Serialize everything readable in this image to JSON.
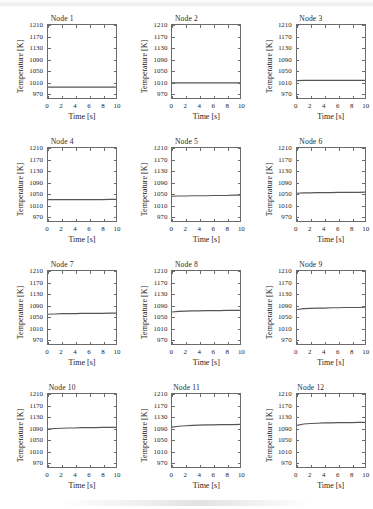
{
  "figure": {
    "layout": {
      "rows": 4,
      "cols": 3,
      "panel_count": 12
    },
    "axis": {
      "xlabel": "Time [s]",
      "ylabel": "Temperature [K]",
      "xticks": [
        0,
        2,
        4,
        6,
        8,
        10
      ],
      "yticks": [
        970,
        1010,
        1050,
        1090,
        1130,
        1170,
        1210
      ],
      "xlim": [
        0,
        10
      ],
      "ylim": [
        950,
        1210
      ],
      "grid": false,
      "line_color": "#555555"
    }
  },
  "chart_data": [
    {
      "type": "line",
      "title": "Node 1",
      "xlabel": "Time [s]",
      "ylabel": "Temperature [K]",
      "xlim": [
        0,
        10
      ],
      "ylim": [
        950,
        1210
      ],
      "xticks": [
        0,
        2,
        4,
        6,
        8,
        10
      ],
      "yticks": [
        970,
        1010,
        1050,
        1090,
        1130,
        1170,
        1210
      ],
      "grid": false,
      "x": [
        0,
        1,
        2,
        3,
        4,
        5,
        6,
        7,
        8,
        9,
        10
      ],
      "values": [
        989,
        989,
        989,
        989,
        989,
        989,
        989,
        989,
        989,
        989,
        989
      ]
    },
    {
      "type": "line",
      "title": "Node 2",
      "xlabel": "Time [s]",
      "ylabel": "Temperature [K]",
      "xlim": [
        0,
        10
      ],
      "ylim": [
        950,
        1210
      ],
      "xticks": [
        0,
        2,
        4,
        6,
        8,
        10
      ],
      "yticks": [
        970,
        1010,
        1050,
        1090,
        1130,
        1170,
        1210
      ],
      "grid": false,
      "x": [
        0,
        1,
        2,
        3,
        4,
        5,
        6,
        7,
        8,
        9,
        10
      ],
      "values": [
        1004,
        1004,
        1004,
        1004,
        1004,
        1004,
        1004,
        1004,
        1004,
        1004,
        1004
      ]
    },
    {
      "type": "line",
      "title": "Node 3",
      "xlabel": "Time [s]",
      "ylabel": "Temperature [K]",
      "xlim": [
        0,
        10
      ],
      "ylim": [
        950,
        1210
      ],
      "xticks": [
        0,
        2,
        4,
        6,
        8,
        10
      ],
      "yticks": [
        970,
        1010,
        1050,
        1090,
        1130,
        1170,
        1210
      ],
      "grid": false,
      "x": [
        0,
        1,
        2,
        3,
        4,
        5,
        6,
        7,
        8,
        9,
        10
      ],
      "values": [
        1012,
        1013,
        1013,
        1013,
        1013,
        1013,
        1013,
        1013,
        1013,
        1013,
        1013
      ]
    },
    {
      "type": "line",
      "title": "Node 4",
      "xlabel": "Time [s]",
      "ylabel": "Temperature [K]",
      "xlim": [
        0,
        10
      ],
      "ylim": [
        950,
        1210
      ],
      "xticks": [
        0,
        2,
        4,
        6,
        8,
        10
      ],
      "yticks": [
        970,
        1010,
        1050,
        1090,
        1130,
        1170,
        1210
      ],
      "grid": false,
      "x": [
        0,
        1,
        2,
        3,
        4,
        5,
        6,
        7,
        8,
        9,
        10
      ],
      "values": [
        1026,
        1026,
        1026,
        1026,
        1026,
        1026,
        1026,
        1026,
        1026,
        1027,
        1027
      ]
    },
    {
      "type": "line",
      "title": "Node 5",
      "xlabel": "Time [s]",
      "ylabel": "Temperature [K]",
      "xlim": [
        0,
        10
      ],
      "ylim": [
        950,
        1210
      ],
      "xticks": [
        0,
        2,
        4,
        6,
        8,
        10
      ],
      "yticks": [
        970,
        1010,
        1050,
        1090,
        1130,
        1170,
        1210
      ],
      "grid": false,
      "x": [
        0,
        1,
        2,
        3,
        4,
        5,
        6,
        7,
        8,
        9,
        10
      ],
      "values": [
        1038,
        1039,
        1039,
        1040,
        1040,
        1040,
        1041,
        1041,
        1041,
        1042,
        1042
      ]
    },
    {
      "type": "line",
      "title": "Node 6",
      "xlabel": "Time [s]",
      "ylabel": "Temperature [K]",
      "xlim": [
        0,
        10
      ],
      "ylim": [
        950,
        1210
      ],
      "xticks": [
        0,
        2,
        4,
        6,
        8,
        10
      ],
      "yticks": [
        970,
        1010,
        1050,
        1090,
        1130,
        1170,
        1210
      ],
      "grid": false,
      "x": [
        0,
        1,
        2,
        3,
        4,
        5,
        6,
        7,
        8,
        9,
        10
      ],
      "values": [
        1049,
        1050,
        1050,
        1051,
        1051,
        1051,
        1052,
        1052,
        1052,
        1052,
        1053
      ]
    },
    {
      "type": "line",
      "title": "Node 7",
      "xlabel": "Time [s]",
      "ylabel": "Temperature [K]",
      "xlim": [
        0,
        10
      ],
      "ylim": [
        950,
        1210
      ],
      "xticks": [
        0,
        2,
        4,
        6,
        8,
        10
      ],
      "yticks": [
        970,
        1010,
        1050,
        1090,
        1130,
        1170,
        1210
      ],
      "grid": false,
      "x": [
        0,
        1,
        2,
        3,
        4,
        5,
        6,
        7,
        8,
        9,
        10
      ],
      "values": [
        1056,
        1057,
        1058,
        1058,
        1058,
        1059,
        1059,
        1059,
        1059,
        1060,
        1060
      ]
    },
    {
      "type": "line",
      "title": "Node 8",
      "xlabel": "Time [s]",
      "ylabel": "Temperature [K]",
      "xlim": [
        0,
        10
      ],
      "ylim": [
        950,
        1210
      ],
      "xticks": [
        0,
        2,
        4,
        6,
        8,
        10
      ],
      "yticks": [
        970,
        1010,
        1050,
        1090,
        1130,
        1170,
        1210
      ],
      "grid": false,
      "x": [
        0,
        1,
        2,
        3,
        4,
        5,
        6,
        7,
        8,
        9,
        10
      ],
      "values": [
        1064,
        1066,
        1067,
        1068,
        1068,
        1069,
        1069,
        1069,
        1070,
        1070,
        1070
      ]
    },
    {
      "type": "line",
      "title": "Node 9",
      "xlabel": "Time [s]",
      "ylabel": "Temperature [K]",
      "xlim": [
        0,
        10
      ],
      "ylim": [
        950,
        1210
      ],
      "xticks": [
        0,
        2,
        4,
        6,
        8,
        10
      ],
      "yticks": [
        970,
        1010,
        1050,
        1090,
        1130,
        1170,
        1210
      ],
      "grid": false,
      "x": [
        0,
        1,
        2,
        3,
        4,
        5,
        6,
        7,
        8,
        9,
        10
      ],
      "values": [
        1073,
        1076,
        1077,
        1078,
        1078,
        1079,
        1079,
        1080,
        1080,
        1080,
        1081
      ]
    },
    {
      "type": "line",
      "title": "Node 10",
      "xlabel": "Time [s]",
      "ylabel": "Temperature [K]",
      "xlim": [
        0,
        10
      ],
      "ylim": [
        950,
        1210
      ],
      "xticks": [
        0,
        2,
        4,
        6,
        8,
        10
      ],
      "yticks": [
        970,
        1010,
        1050,
        1090,
        1130,
        1170,
        1210
      ],
      "grid": false,
      "x": [
        0,
        1,
        2,
        3,
        4,
        5,
        6,
        7,
        8,
        9,
        10
      ],
      "values": [
        1085,
        1087,
        1088,
        1089,
        1089,
        1090,
        1090,
        1090,
        1091,
        1091,
        1091
      ]
    },
    {
      "type": "line",
      "title": "Node 11",
      "xlabel": "Time [s]",
      "ylabel": "Temperature [K]",
      "xlim": [
        0,
        10
      ],
      "ylim": [
        950,
        1210
      ],
      "xticks": [
        0,
        2,
        4,
        6,
        8,
        10
      ],
      "yticks": [
        970,
        1010,
        1050,
        1090,
        1130,
        1170,
        1210
      ],
      "grid": false,
      "x": [
        0,
        1,
        2,
        3,
        4,
        5,
        6,
        7,
        8,
        9,
        10
      ],
      "values": [
        1092,
        1095,
        1097,
        1098,
        1099,
        1100,
        1100,
        1101,
        1101,
        1101,
        1102
      ]
    },
    {
      "type": "line",
      "title": "Node 12",
      "xlabel": "Time [s]",
      "ylabel": "Temperature [K]",
      "xlim": [
        0,
        10
      ],
      "ylim": [
        950,
        1210
      ],
      "xticks": [
        0,
        2,
        4,
        6,
        8,
        10
      ],
      "yticks": [
        970,
        1010,
        1050,
        1090,
        1130,
        1170,
        1210
      ],
      "grid": false,
      "x": [
        0,
        1,
        2,
        3,
        4,
        5,
        6,
        7,
        8,
        9,
        10
      ],
      "values": [
        1098,
        1103,
        1105,
        1106,
        1107,
        1107,
        1108,
        1108,
        1108,
        1109,
        1109
      ]
    }
  ]
}
